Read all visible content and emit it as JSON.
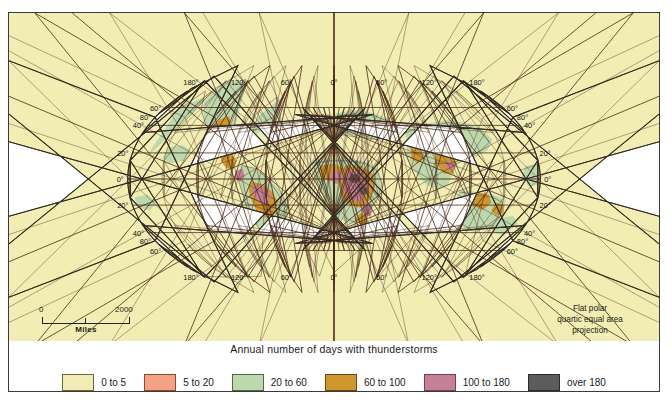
{
  "title": "Annual number of days with thunderstorms",
  "projection_note": "Flat polar\nquartic equal area\nprojection",
  "projection_lines": [
    "Flat polar",
    "quartic equal area",
    "projection"
  ],
  "scale": {
    "min": "0",
    "max": "2000",
    "units": "Miles"
  },
  "legend": {
    "items": [
      {
        "label": "0 to 5",
        "color": "#f2eeb3",
        "border": "#6e6440"
      },
      {
        "label": "5 to 20",
        "color": "#f5a183",
        "border": "#8a4a33"
      },
      {
        "label": "20 to 60",
        "color": "#bcd9ad",
        "border": "#4e6a44"
      },
      {
        "label": "60 to 100",
        "color": "#cf962c",
        "border": "#6b4a13"
      },
      {
        "label": "100 to 180",
        "color": "#c48098",
        "border": "#7a3d52"
      },
      {
        "label": "over 180",
        "color": "#5c5c5c",
        "border": "#2b2b2b"
      }
    ]
  },
  "graticule": {
    "longitude_labels_top": [
      "180°",
      "120°",
      "60°",
      "0°",
      "60°",
      "120°",
      "180°"
    ],
    "longitude_labels_bottom": [
      "180°",
      "120°",
      "60°",
      "0°",
      "60°",
      "120°",
      "180°"
    ],
    "latitude_labels_left": [
      "80°",
      "60°",
      "40°",
      "20°",
      "0°",
      "20°",
      "40°",
      "60°",
      "80°"
    ],
    "latitude_labels_right": [
      "80°",
      "60°",
      "40°",
      "20°",
      "0°",
      "20°",
      "40°",
      "60°",
      "80°"
    ],
    "latitude_values": [
      80,
      60,
      40,
      20,
      0,
      -20,
      -40,
      -60,
      -80
    ],
    "longitude_values": [
      -180,
      -120,
      -60,
      0,
      60,
      120,
      180
    ],
    "line_color": "#4a2b18"
  },
  "chart_data": {
    "type": "map",
    "title": "Annual number of days with thunderstorms",
    "projection": "Flat polar quartic equal area",
    "variable": "Annual number of days with thunderstorms",
    "classes": [
      "0 to 5",
      "5 to 20",
      "20 to 60",
      "60 to 100",
      "100 to 180",
      "over 180"
    ],
    "class_colors": [
      "#f2eeb3",
      "#f5a183",
      "#bcd9ad",
      "#cf962c",
      "#c48098",
      "#5c5c5c"
    ],
    "regions": [
      {
        "name": "Arctic and high northern latitudes",
        "class": "0 to 5"
      },
      {
        "name": "Antarctic and high southern latitudes",
        "class": "0 to 5"
      },
      {
        "name": "Sahara and North Africa",
        "class": "5 to 20"
      },
      {
        "name": "Mid-latitude oceans",
        "class": "5 to 20"
      },
      {
        "name": "North America interior",
        "class": "20 to 60"
      },
      {
        "name": "Europe and Mediterranean",
        "class": "20 to 60"
      },
      {
        "name": "Southern and eastern Asia",
        "class": "20 to 60"
      },
      {
        "name": "Rocky Mountains and Mexican plateau",
        "class": "60 to 100"
      },
      {
        "name": "Amazon basin",
        "class": "60 to 100"
      },
      {
        "name": "Indochina and northern Australia",
        "class": "60 to 100"
      },
      {
        "name": "Equatorial Africa margins",
        "class": "60 to 100"
      },
      {
        "name": "Central African interior",
        "class": "100 to 180"
      },
      {
        "name": "Northwestern South America",
        "class": "100 to 180"
      },
      {
        "name": "Congo and Lake Victoria highlands",
        "class": "over 180"
      }
    ]
  }
}
